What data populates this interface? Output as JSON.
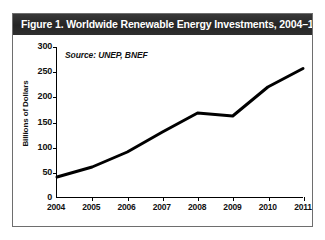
{
  "figure": {
    "title": "Figure 1. Worldwide Renewable Energy Investments,  2004–11",
    "source_note": "Source: UNEP, BNEF",
    "frame_color": "#6e6e6e",
    "title_bar_color": "#2b2b2b",
    "title_text_color": "#ffffff",
    "line_color": "#000000",
    "plot_background": "#ffffff"
  },
  "chart_data": {
    "type": "line",
    "title": "Figure 1. Worldwide Renewable Energy Investments,  2004–11",
    "subtitle": "",
    "annotations": [
      "Source: UNEP, BNEF"
    ],
    "xlabel": "",
    "ylabel": "Billions of Dollars",
    "categories": [
      "2004",
      "2005",
      "2006",
      "2007",
      "2008",
      "2009",
      "2010",
      "2011"
    ],
    "x": [
      2004,
      2005,
      2006,
      2007,
      2008,
      2009,
      2010,
      2011
    ],
    "values": [
      40,
      60,
      90,
      130,
      168,
      162,
      220,
      257
    ],
    "series": [
      {
        "name": "Worldwide Renewable Energy Investments",
        "values": [
          40,
          60,
          90,
          130,
          168,
          162,
          220,
          257
        ],
        "color": "#000000"
      }
    ],
    "ylim": [
      0,
      300
    ],
    "xlim": [
      2004,
      2011
    ],
    "yticks": [
      0,
      50,
      100,
      150,
      200,
      250,
      300
    ],
    "ytick_labels": [
      "0",
      "50",
      "100",
      "150",
      "200",
      "250",
      "300"
    ],
    "xticks": [
      2004,
      2005,
      2006,
      2007,
      2008,
      2009,
      2010,
      2011
    ],
    "xtick_labels": [
      "2004",
      "2005",
      "2006",
      "2007",
      "2008",
      "2009",
      "2010",
      "2011"
    ],
    "grid": false,
    "legend": false,
    "legend_position": "none",
    "line_width": 3,
    "units": "Billions of Dollars"
  }
}
